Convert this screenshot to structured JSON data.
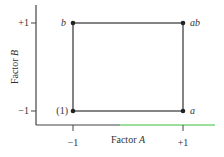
{
  "diagram": {
    "type": "2^2 factorial design square",
    "x_axis": {
      "label": "Factor",
      "label_var": "A",
      "ticks": [
        "−1",
        "+1"
      ]
    },
    "y_axis": {
      "label": "Factor",
      "label_var": "B",
      "ticks": [
        "+1",
        "−1"
      ]
    },
    "corners": [
      {
        "id": "b",
        "label": "b",
        "x": "−1",
        "y": "+1"
      },
      {
        "id": "ab",
        "label": "ab",
        "x": "+1",
        "y": "+1"
      },
      {
        "id": "one",
        "label": "(1)",
        "x": "−1",
        "y": "−1"
      },
      {
        "id": "a",
        "label": "a",
        "x": "+1",
        "y": "−1"
      }
    ],
    "colors": {
      "line": "#333333",
      "axis_accent": "#3bbf3b"
    }
  }
}
